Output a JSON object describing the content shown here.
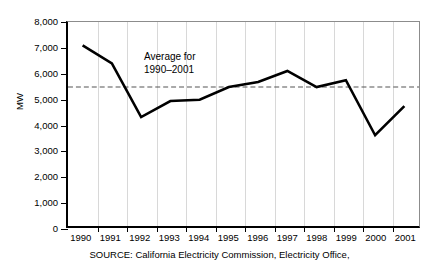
{
  "chart_data": {
    "type": "line",
    "title": "",
    "subtitle": "",
    "xlabel": "",
    "ylabel": "MW",
    "categories": [
      "1990",
      "1991",
      "1992",
      "1993",
      "1994",
      "1995",
      "1996",
      "1997",
      "1998",
      "1999",
      "2000",
      "2001"
    ],
    "values": [
      7080,
      6380,
      4270,
      4900,
      4950,
      5450,
      5650,
      6080,
      5450,
      5720,
      3560,
      4700
    ],
    "series": [
      {
        "name": "MW",
        "values": [
          7080,
          6380,
          4270,
          4900,
          4950,
          5450,
          5650,
          6080,
          5450,
          5720,
          3560,
          4700
        ],
        "color": "#000000",
        "style": "solid"
      }
    ],
    "reference_line": {
      "label_line1": "Average for",
      "label_line2": "1990–2001",
      "value": 5450,
      "style": "dashed",
      "color": "#555555"
    },
    "ylim": [
      0,
      8000
    ],
    "yticks": [
      0,
      1000,
      2000,
      3000,
      4000,
      5000,
      6000,
      7000,
      8000
    ],
    "ytick_labels": [
      "0",
      "1,000",
      "2,000",
      "3,000",
      "4,000",
      "5,000",
      "6,000",
      "7,000",
      "8,000"
    ],
    "grid": false,
    "legend": "none"
  },
  "annotation": {
    "line1": "Average for",
    "line2": "1990–2001"
  },
  "caption": {
    "source": "SOURCE:  California Electricity Commission, Electricity Office,"
  }
}
